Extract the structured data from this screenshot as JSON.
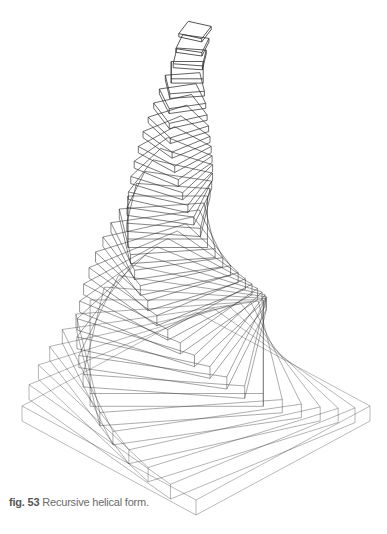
{
  "figure": {
    "caption_number": "fig. 53",
    "caption_text": "Recursive helical form.",
    "line_color": "#2a2a2a",
    "background": "#ffffff",
    "geometry": {
      "type": "stacked rotating square slabs (isometric wireframe)",
      "slab_count": 34,
      "base_center": [
        196,
        406
      ],
      "base_half_width": 174,
      "base_half_depth_ratio": 0.54,
      "slab_thickness_start": 15,
      "slab_thickness_end": 3.2,
      "scale_factor_per_level": 0.945,
      "rotation_per_level_deg": 7.5,
      "center_drift": [
        [
          196,
          406
        ],
        [
          150,
          300
        ],
        [
          165,
          180
        ],
        [
          195,
          30
        ]
      ]
    }
  }
}
